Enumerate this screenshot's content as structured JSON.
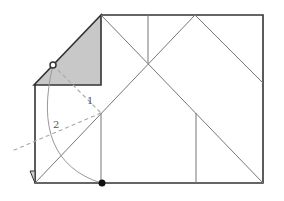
{
  "diagram": {
    "type": "origami-fold-diagram",
    "step_labels": [
      "1",
      "2"
    ],
    "colors": {
      "outline": "#333333",
      "crease": "#777777",
      "dashed": "#aaaaaa",
      "shaded": "#c8c8c8",
      "arc": "#999999",
      "dot": "#111111"
    },
    "markers": {
      "reference_point": "hollow-circle",
      "target_point": "filled-dot"
    }
  }
}
